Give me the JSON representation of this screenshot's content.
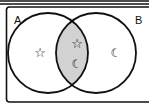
{
  "diagram": {
    "type": "venn",
    "sets": [
      {
        "label": "A"
      },
      {
        "label": "B"
      }
    ],
    "regions": {
      "a_only": [
        "star"
      ],
      "a_and_b": [
        "star",
        "moon"
      ],
      "b_only": [
        "moon"
      ]
    },
    "shaded_region": "A ∩ B",
    "colors": {
      "shade": "#d2d2d2",
      "stroke": "#111111"
    },
    "symbols": {
      "star": "☆",
      "moon": "☾"
    }
  }
}
